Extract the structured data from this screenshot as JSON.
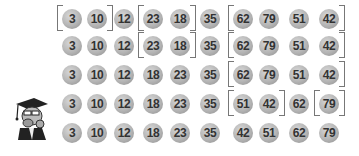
{
  "diagram": {
    "type": "merge-sort-steps",
    "column_x": [
      72,
      97,
      124,
      153,
      180,
      210,
      243,
      269,
      299,
      329
    ],
    "row_y": [
      7,
      34,
      63,
      92,
      121
    ],
    "rows": [
      {
        "values": [
          "3",
          "10",
          "12",
          "23",
          "18",
          "35",
          "62",
          "79",
          "51",
          "42"
        ],
        "brackets": [
          {
            "open": 0,
            "close": 1
          },
          {
            "open": 3,
            "close": 4
          },
          {
            "open": 6,
            "close": 9
          }
        ]
      },
      {
        "values": [
          "3",
          "10",
          "12",
          "23",
          "18",
          "35",
          "62",
          "79",
          "51",
          "42"
        ],
        "brackets": [
          {
            "open": 3,
            "close": 4
          },
          {
            "open": 6,
            "close": 9
          }
        ]
      },
      {
        "values": [
          "3",
          "10",
          "12",
          "18",
          "23",
          "35",
          "62",
          "79",
          "51",
          "42"
        ],
        "brackets": [
          {
            "open": 6,
            "close": 9
          }
        ]
      },
      {
        "values": [
          "3",
          "10",
          "12",
          "18",
          "23",
          "35",
          "51",
          "42",
          "62",
          "79"
        ],
        "brackets": [
          {
            "open": 6,
            "close": 7
          },
          {
            "open": 9,
            "close": 9
          }
        ]
      },
      {
        "values": [
          "3",
          "10",
          "12",
          "18",
          "23",
          "35",
          "42",
          "51",
          "62",
          "79"
        ],
        "brackets": []
      }
    ]
  },
  "mascot": {
    "icon": "professor-mascot-icon"
  }
}
